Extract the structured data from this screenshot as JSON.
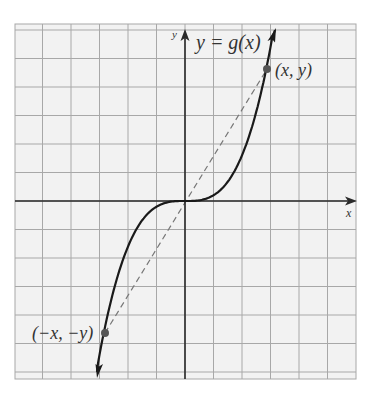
{
  "figure": {
    "title_label": "y = g(x)",
    "x_axis_label": "x",
    "y_axis_label": "y",
    "point_labels": {
      "positive": "(x, y)",
      "negative": "(−x, −y)"
    },
    "colors": {
      "grid_line": "#a8a8a8",
      "grid_bg": "#f2f2f2",
      "axis": "#2a2a2a",
      "curve": "#1a1a1a",
      "dashed_segment": "#777777",
      "point": "#555555",
      "text": "#333333"
    }
  },
  "chart_data": {
    "type": "line",
    "title": "y = g(x)",
    "xlabel": "x",
    "ylabel": "y",
    "grid": true,
    "grid_range_units": {
      "x": [
        -6,
        6
      ],
      "y": [
        -6.2,
        6.2
      ]
    },
    "series": [
      {
        "name": "g(x)",
        "style": "solid",
        "x": [
          -3.0,
          -2.5,
          -2.0,
          -1.5,
          -1.0,
          -0.5,
          0,
          0.5,
          1.0,
          1.5,
          2.0,
          2.5,
          3.0
        ],
        "y": [
          -5.4,
          -4.2,
          -2.4,
          -1.1,
          -0.3,
          -0.05,
          0,
          0.05,
          0.3,
          1.1,
          2.4,
          4.2,
          5.4
        ]
      },
      {
        "name": "symmetric chord",
        "style": "dashed",
        "x": [
          -2.9,
          2.9
        ],
        "y": [
          -4.6,
          4.6
        ]
      }
    ],
    "points": [
      {
        "label": "(x, y)",
        "x": 2.9,
        "y": 4.6
      },
      {
        "label": "(−x, −y)",
        "x": -2.9,
        "y": -4.6
      }
    ]
  }
}
